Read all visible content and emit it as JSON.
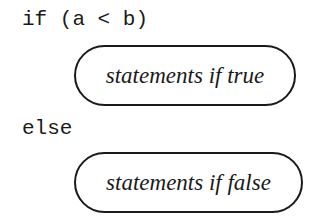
{
  "diagram": {
    "if_line": "if (a < b)",
    "true_block": "statements if true",
    "else_line": "else",
    "false_block": "statements if false"
  },
  "colors": {
    "stroke": "#1a1a1a",
    "background": "#ffffff"
  }
}
